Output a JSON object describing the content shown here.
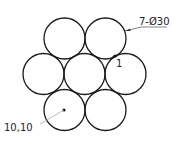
{
  "drawing": {
    "circle_stroke": "#1a1a1a",
    "leader_color": "#9a9a9a",
    "circles": [
      {
        "cx": 64.5,
        "cy": 38.5,
        "r": 20.5
      },
      {
        "cx": 105.5,
        "cy": 38.5,
        "r": 20.5
      },
      {
        "cx": 43.5,
        "cy": 74,
        "r": 20.5
      },
      {
        "cx": 84.5,
        "cy": 74,
        "r": 20.5
      },
      {
        "cx": 125.5,
        "cy": 74,
        "r": 20.5
      },
      {
        "cx": 64.5,
        "cy": 110,
        "r": 20.5
      },
      {
        "cx": 105.5,
        "cy": 110,
        "r": 20.5
      }
    ],
    "labels": {
      "diameter": "7-Ø30",
      "gap": "1",
      "coordinate": "10,10"
    }
  }
}
